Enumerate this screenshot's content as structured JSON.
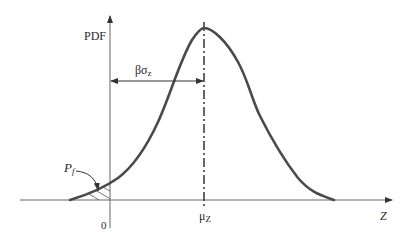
{
  "diagram": {
    "type": "probability-density-function",
    "y_axis_label": "PDF",
    "x_axis_label": "Z",
    "origin_label": "0",
    "mean_label_main": "μ",
    "mean_label_sub": "Z",
    "distance_label_main": "βσ",
    "distance_label_sub": "z",
    "failure_prob_label_main": "P",
    "failure_prob_label_sub": "f",
    "colors": {
      "curve": "#4a4a4a",
      "axes": "#555555",
      "text": "#2a2a2a"
    }
  }
}
